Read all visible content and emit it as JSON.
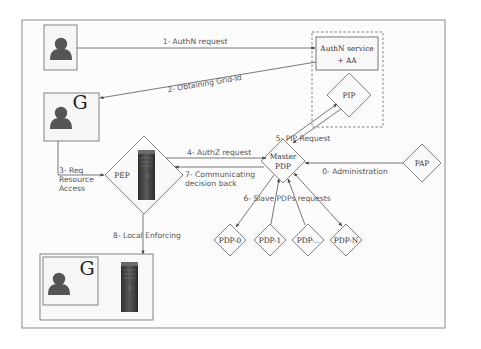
{
  "diagram": {
    "type": "authorization-architecture",
    "nodes": {
      "user_top": {
        "icon": "user-icon"
      },
      "user_grid": {
        "icon": "user-icon",
        "badge": "G"
      },
      "authn_service": {
        "line1": "AuthN service",
        "line2": "+ AA"
      },
      "pip": {
        "label": "PIP"
      },
      "pep": {
        "label": "PEP",
        "icon": "server-icon"
      },
      "master_pdp": {
        "line1": "Master",
        "line2": "PDP"
      },
      "pap": {
        "label": "PAP"
      },
      "slave_pdps": [
        {
          "label": "PDP-0"
        },
        {
          "label": "PDP-1"
        },
        {
          "label": "PDP-.."
        },
        {
          "label": "PDP-N"
        }
      ],
      "enforced_user": {
        "icon": "user-icon",
        "badge": "G",
        "server_icon": "server-icon"
      }
    },
    "edges": {
      "e1": {
        "label": "1- AuthN request"
      },
      "e2": {
        "label": "2- Obtaining Grid-Id"
      },
      "e3": {
        "line1": "3- Req",
        "line2": "Resource",
        "line3": "Access"
      },
      "e4": {
        "label": "4- AuthZ request"
      },
      "e5": {
        "label": "5- PIP Request"
      },
      "e6": {
        "label": "6- Slave PDPs requests"
      },
      "e7": {
        "line1": "7- Communicating",
        "line2": "decision back"
      },
      "e8": {
        "label": "8- Local Enforcing"
      },
      "e0": {
        "label": "0- Administration"
      }
    },
    "colors": {
      "frame": "#8a8a8a",
      "line": "#555555",
      "user_fill": "#555555",
      "server_dark": "#3c3c3c",
      "background": "#fcfcfc"
    }
  }
}
